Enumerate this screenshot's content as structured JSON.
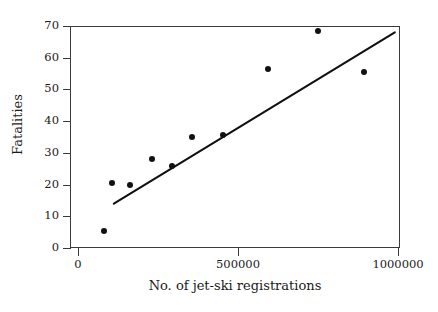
{
  "chart_data": {
    "type": "scatter",
    "title": "",
    "xlabel": "No. of jet-ski registrations",
    "ylabel": "Fatalities",
    "xlim": [
      0,
      1050000
    ],
    "ylim": [
      0,
      72
    ],
    "xticks": [
      0,
      500000,
      1000000
    ],
    "xtick_labels": [
      "0",
      "500000",
      "1000000"
    ],
    "yticks": [
      0,
      10,
      20,
      30,
      40,
      50,
      60,
      70
    ],
    "ytick_labels": [
      "0",
      "10",
      "20",
      "30",
      "40",
      "50",
      "60",
      "70"
    ],
    "grid": false,
    "legend": null,
    "marker_color": "#111111",
    "line_color": "#111111",
    "points": [
      {
        "x": 82000,
        "y": 5.5
      },
      {
        "x": 107000,
        "y": 20.5
      },
      {
        "x": 163000,
        "y": 20.0
      },
      {
        "x": 232000,
        "y": 28.0
      },
      {
        "x": 293000,
        "y": 26.0
      },
      {
        "x": 356000,
        "y": 35.0
      },
      {
        "x": 453000,
        "y": 35.5
      },
      {
        "x": 594000,
        "y": 56.5
      },
      {
        "x": 750000,
        "y": 68.5
      },
      {
        "x": 894000,
        "y": 55.5
      }
    ],
    "trend_line": {
      "type": "linear-fit",
      "x_start": 112000,
      "y_start": 14.0,
      "x_end": 990000,
      "y_end": 68.0
    }
  }
}
